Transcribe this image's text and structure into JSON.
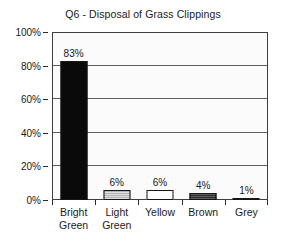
{
  "chart_data": {
    "type": "bar",
    "title": "Q6 - Disposal of Grass Clippings",
    "xlabel": "",
    "ylabel": "",
    "categories": [
      "Bright Green",
      "Light Green",
      "Yellow",
      "Brown",
      "Grey"
    ],
    "values": [
      83,
      6,
      6,
      4,
      1
    ],
    "value_labels": [
      "83%",
      "6%",
      "6%",
      "4%",
      "1%"
    ],
    "ylim": [
      0,
      100
    ],
    "ytick_values": [
      0,
      20,
      40,
      60,
      80,
      100
    ],
    "ytick_labels": [
      "0%",
      "20%",
      "40%",
      "60%",
      "80%",
      "100%"
    ],
    "grid": "horizontal",
    "legend": "none",
    "bar_fills": [
      "solid-black",
      "mid-gray",
      "white",
      "dark-gray",
      "light-gray"
    ],
    "bar_colors": [
      "#0a0a0a",
      "#b4b4b4",
      "#ffffff",
      "#2e2e2e",
      "#9a9a9a"
    ],
    "bar_outline_color": "#151515",
    "plot_background": "#fbfbfb",
    "gridline_color": "#5e5e5e",
    "axis_color": "#3d3d3d",
    "text_color": "#1a1a1a",
    "category_label_lines": [
      [
        "Bright",
        "Green"
      ],
      [
        "Light",
        "Green"
      ],
      [
        "Yellow",
        ""
      ],
      [
        "Brown",
        ""
      ],
      [
        "Grey",
        ""
      ]
    ]
  }
}
